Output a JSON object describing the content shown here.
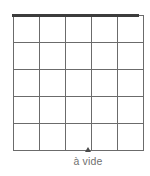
{
  "figure": {
    "type": "grid-diagram",
    "background_color": "#ffffff",
    "width": 150,
    "height": 176
  },
  "grid": {
    "rows": 5,
    "columns": 5,
    "line_color": "#6b6b6b",
    "top_rule_color": "#3c3c3c",
    "cells": [
      [
        "",
        "",
        "",
        "",
        ""
      ],
      [
        "",
        "",
        "",
        "",
        ""
      ],
      [
        "",
        "",
        "",
        "",
        ""
      ],
      [
        "",
        "",
        "",
        "",
        ""
      ],
      [
        "",
        "",
        "",
        "",
        ""
      ]
    ]
  },
  "marker": {
    "icon": "triangle-up-icon",
    "color": "#4a4a4a",
    "aligned_to_column_line": 3
  },
  "caption": {
    "text": "à vide",
    "color": "#6f6f6f"
  }
}
